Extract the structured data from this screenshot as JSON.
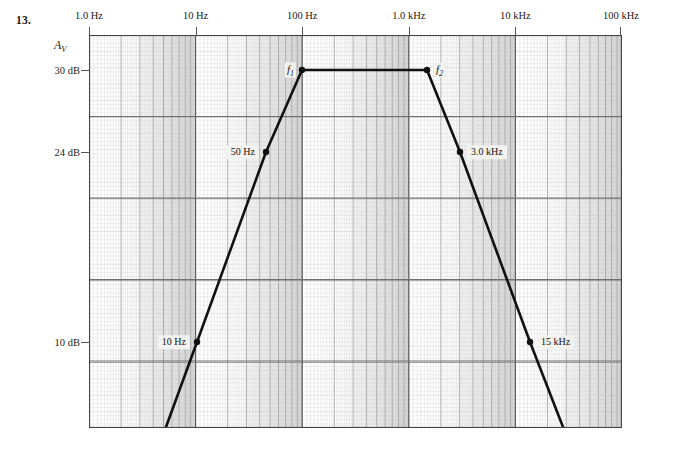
{
  "problem": {
    "number": "13."
  },
  "axes": {
    "y_title": "A",
    "y_title_sub": "V",
    "x_ticks": [
      {
        "label": "1.0 Hz",
        "hz": 1
      },
      {
        "label": "10 Hz",
        "hz": 10
      },
      {
        "label": "100 Hz",
        "hz": 100
      },
      {
        "label": "1.0 kHz",
        "hz": 1000
      },
      {
        "label": "10 kHz",
        "hz": 10000
      },
      {
        "label": "100 kHz",
        "hz": 100000
      }
    ],
    "y_ticks": [
      {
        "label": "30 dB",
        "db": 30
      },
      {
        "label": "24 dB",
        "db": 24
      },
      {
        "label": "10 dB",
        "db": 10
      }
    ],
    "x_scale": "log",
    "x_range_hz": [
      1,
      100000
    ],
    "y_range_db": [
      0,
      36
    ],
    "grid": "log-log graph paper, major decade lines plus minor log divisions"
  },
  "callouts": {
    "c1": "10 Hz",
    "c2": "50 Hz",
    "c3": "3.0 kHz",
    "c4": "15 kHz",
    "f1": "f",
    "f1_sub": "1",
    "f2": "f",
    "f2_sub": "2"
  },
  "colors": {
    "curve": "#111111",
    "grid_major": "#8a8a8a",
    "grid_minor": "#c9c9c9",
    "frame": "#444444",
    "band_shade": "#e2e2e2",
    "callout_bg": "#f2f2ef",
    "page_bg": "#ffffff"
  },
  "chart_data": {
    "type": "line",
    "title": "",
    "xlabel": "",
    "ylabel": "Av",
    "x_scale": "log",
    "xlim": [
      1,
      100000
    ],
    "ylim": [
      0,
      36
    ],
    "xtick_labels": [
      "1.0 Hz",
      "10 Hz",
      "100 Hz",
      "1.0 kHz",
      "10 kHz",
      "100 kHz"
    ],
    "xtick_values": [
      1,
      10,
      100,
      1000,
      10000,
      100000
    ],
    "ytick_labels": [
      "30 dB",
      "24 dB",
      "10 dB"
    ],
    "ytick_values": [
      30,
      24,
      10
    ],
    "grid": true,
    "legend": "none",
    "series": [
      {
        "name": "Voltage gain response",
        "points": [
          {
            "freq_hz": 3.2,
            "gain_db": 0.0,
            "label": ""
          },
          {
            "freq_hz": 10,
            "gain_db": 10.0,
            "label": "10 Hz"
          },
          {
            "freq_hz": 50,
            "gain_db": 24.0,
            "label": "50 Hz"
          },
          {
            "freq_hz": 100,
            "gain_db": 30.0,
            "label": "f1"
          },
          {
            "freq_hz": 1000,
            "gain_db": 30.0,
            "label": "f2"
          },
          {
            "freq_hz": 3000,
            "gain_db": 24.0,
            "label": "3.0 kHz"
          },
          {
            "freq_hz": 15000,
            "gain_db": 10.0,
            "label": "15 kHz"
          },
          {
            "freq_hz": 33000,
            "gain_db": 0.0,
            "label": ""
          }
        ]
      }
    ],
    "annotations": [
      {
        "text": "f1",
        "freq_hz": 100,
        "gain_db": 30,
        "desc": "lower cutoff frequency"
      },
      {
        "text": "f2",
        "freq_hz": 1000,
        "gain_db": 30,
        "desc": "upper cutoff frequency"
      },
      {
        "text": "10 Hz",
        "freq_hz": 10,
        "gain_db": 10
      },
      {
        "text": "50 Hz",
        "freq_hz": 50,
        "gain_db": 24
      },
      {
        "text": "3.0 kHz",
        "freq_hz": 3000,
        "gain_db": 24
      },
      {
        "text": "15 kHz",
        "freq_hz": 15000,
        "gain_db": 10
      }
    ],
    "midband_gain_db": 30,
    "bandwidth_hz": 900
  }
}
